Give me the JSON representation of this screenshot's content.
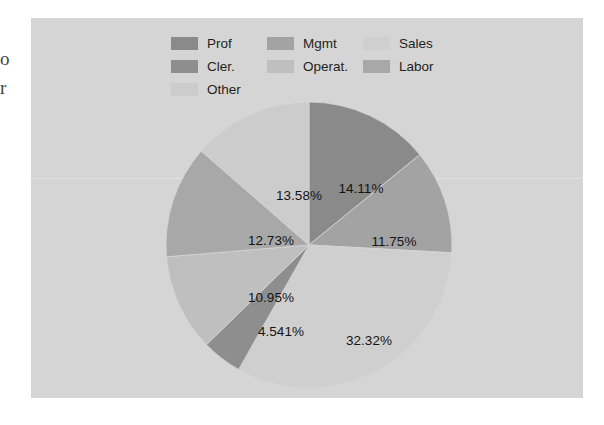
{
  "page": {
    "edge_text_lines": [
      "o",
      "r"
    ],
    "background_color": "#ffffff",
    "panel_color": "#d5d5d5"
  },
  "chart_data": {
    "type": "pie",
    "title": "",
    "subtitle": "",
    "xlabel": "",
    "ylabel": "",
    "grid": false,
    "legend_position": "top",
    "start_angle_deg": 0,
    "direction": "clockwise",
    "categories": [
      "Prof",
      "Mgmt",
      "Sales",
      "Cler.",
      "Operat.",
      "Labor",
      "Other"
    ],
    "values": [
      14.11,
      11.75,
      32.32,
      4.541,
      10.95,
      12.73,
      13.58
    ],
    "value_labels": [
      "14.11%",
      "11.75%",
      "32.32%",
      "4.541%",
      "10.95%",
      "12.73%",
      "13.58%"
    ],
    "colors": [
      "#8a8a8a",
      "#a3a3a3",
      "#cfcfcf",
      "#8e8e8e",
      "#bfbfbf",
      "#a8a8a8",
      "#cccccc"
    ],
    "slices": [
      {
        "label": "Prof",
        "value": 14.11,
        "value_label": "14.11%",
        "color": "#8a8a8a",
        "label_x": 330,
        "label_y": 170
      },
      {
        "label": "Mgmt",
        "value": 11.75,
        "value_label": "11.75%",
        "color": "#a3a3a3",
        "label_x": 363,
        "label_y": 223
      },
      {
        "label": "Sales",
        "value": 32.32,
        "value_label": "32.32%",
        "color": "#cfcfcf",
        "label_x": 338,
        "label_y": 322
      },
      {
        "label": "Cler.",
        "value": 4.541,
        "value_label": "4.541%",
        "color": "#8e8e8e",
        "label_x": 250,
        "label_y": 313
      },
      {
        "label": "Operat.",
        "value": 10.95,
        "value_label": "10.95%",
        "color": "#bfbfbf",
        "label_x": 240,
        "label_y": 279
      },
      {
        "label": "Labor",
        "value": 12.73,
        "value_label": "12.73%",
        "color": "#a8a8a8",
        "label_x": 240,
        "label_y": 222
      },
      {
        "label": "Other",
        "value": 13.58,
        "value_label": "13.58%",
        "color": "#cccccc",
        "label_x": 268,
        "label_y": 177
      }
    ]
  },
  "legend": {
    "rows": [
      [
        {
          "label": "Prof",
          "color": "#8a8a8a"
        },
        {
          "label": "Mgmt",
          "color": "#a3a3a3"
        },
        {
          "label": "Sales",
          "color": "#cfcfcf"
        }
      ],
      [
        {
          "label": "Cler.",
          "color": "#8e8e8e"
        },
        {
          "label": "Operat.",
          "color": "#bfbfbf"
        },
        {
          "label": "Labor",
          "color": "#a8a8a8"
        }
      ],
      [
        {
          "label": "Other",
          "color": "#cccccc"
        }
      ]
    ]
  }
}
